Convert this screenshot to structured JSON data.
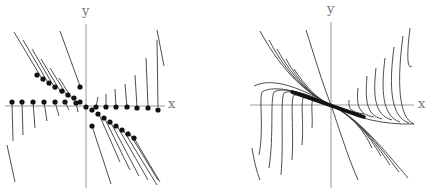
{
  "colors": {
    "axis": "#9a9a9a",
    "curve": "#3a3a3a",
    "dot": "#111111",
    "label": "#7a7a7a",
    "background": "#ffffff"
  },
  "left_panel": {
    "title": "direction-field-with-isocline-points",
    "x_label": "x",
    "y_label": "y",
    "origin": [
      86,
      106
    ],
    "x_axis": [
      5,
      165
    ],
    "y_axis": [
      24,
      188
    ],
    "x_label_pos": [
      168,
      97
    ],
    "y_label_pos": [
      82,
      4
    ],
    "segments": [
      [
        14,
        32,
        44,
        82
      ],
      [
        23,
        40,
        50,
        86
      ],
      [
        32,
        49,
        56,
        90
      ],
      [
        41,
        59,
        62,
        94
      ],
      [
        50,
        68,
        68,
        97
      ],
      [
        59,
        78,
        73,
        100
      ],
      [
        60,
        31,
        80,
        86
      ],
      [
        12,
        102,
        13,
        141
      ],
      [
        22,
        102,
        23,
        135
      ],
      [
        33,
        102,
        35,
        128
      ],
      [
        44,
        102,
        47,
        121
      ],
      [
        55,
        102,
        59,
        116
      ],
      [
        65,
        102,
        69,
        110
      ],
      [
        76,
        102,
        78,
        112
      ],
      [
        96,
        107,
        98,
        97
      ],
      [
        106,
        107,
        106,
        94
      ],
      [
        116,
        107,
        115,
        89
      ],
      [
        127,
        107,
        125,
        84
      ],
      [
        137,
        107,
        135,
        75
      ],
      [
        148,
        107,
        146,
        58
      ],
      [
        158,
        107,
        157,
        40
      ],
      [
        157,
        30,
        164,
        66
      ],
      [
        7,
        145,
        15,
        182
      ],
      [
        92,
        126,
        111,
        184
      ],
      [
        98,
        112,
        120,
        162
      ],
      [
        104,
        117,
        130,
        170
      ],
      [
        110,
        121,
        139,
        176
      ],
      [
        116,
        124,
        148,
        180
      ],
      [
        122,
        128,
        157,
        185
      ],
      [
        128,
        131,
        158,
        180
      ],
      [
        134,
        138,
        160,
        182
      ]
    ],
    "dots": [
      [
        12,
        102
      ],
      [
        22,
        102
      ],
      [
        33,
        102
      ],
      [
        44,
        102
      ],
      [
        55,
        102
      ],
      [
        65,
        102
      ],
      [
        76,
        103
      ],
      [
        86,
        107
      ],
      [
        96,
        107
      ],
      [
        106,
        107
      ],
      [
        116,
        107
      ],
      [
        127,
        107
      ],
      [
        137,
        108
      ],
      [
        148,
        108
      ],
      [
        158,
        110
      ],
      [
        37,
        75
      ],
      [
        43,
        79
      ],
      [
        49,
        83
      ],
      [
        55,
        87
      ],
      [
        62,
        91
      ],
      [
        68,
        95
      ],
      [
        74,
        98
      ],
      [
        80,
        102
      ],
      [
        92,
        110
      ],
      [
        98,
        114
      ],
      [
        104,
        118
      ],
      [
        110,
        122
      ],
      [
        116,
        126
      ],
      [
        122,
        130
      ],
      [
        128,
        134
      ],
      [
        134,
        138
      ],
      [
        80,
        87
      ],
      [
        92,
        126
      ]
    ]
  },
  "right_panel": {
    "title": "solution-curves",
    "x_label": "x",
    "y_label": "y",
    "origin": [
      117,
      105
    ],
    "x_axis": [
      36,
      200
    ],
    "y_axis": [
      22,
      188
    ],
    "x_label_pos": [
      204,
      97
    ],
    "y_label_pos": [
      113,
      2
    ],
    "curves": [
      "M40 86 C60 76 90 90 117 105 C140 118 170 125 200 124",
      "M46 31 C70 75 95 95 117 105 C145 118 170 150 194 178",
      "M55 40 C75 78 97 96 117 105 C143 118 165 145 185 172",
      "M63 49 C80 80 99 97 117 105 C141 117 160 140 176 165",
      "M72 59 C86 84 101 98 117 105 C139 116 155 135 167 156",
      "M80 69 C92 87 103 99 117 105 C137 115 150 130 158 148",
      "M92 30 C100 55 108 82 117 105 C124 125 133 155 144 180",
      "M45 155 C50 130 45 100 48 92 C60 84 90 92 117 105",
      "M55 168 C60 135 56 100 60 92 C70 86 95 95 117 105",
      "M67 175 C70 140 66 100 70 93 C80 88 100 97 117 105",
      "M78 160 C80 130 76 100 80 95 C90 92 105 100 117 105",
      "M88 145 C90 120 86 100 90 97 C100 96 110 102 117 105",
      "M98 128 C99 115 96 100 100 99 C108 100 113 104 117 105",
      "M135 100 C134 110 138 112 150 114",
      "M144 88 C142 105 145 115 160 117",
      "M153 76 C151 100 152 115 168 119",
      "M162 68 C159 95 160 115 178 120",
      "M171 58 C167 90 168 116 186 122",
      "M180 47 C175 85 176 117 195 123",
      "M189 36 C183 80 184 118 200 124",
      "M196 28 C192 60 194 70 198 66",
      "M38 148 C40 160 42 170 46 180"
    ],
    "thick_band": "M78 92 L150 117"
  }
}
